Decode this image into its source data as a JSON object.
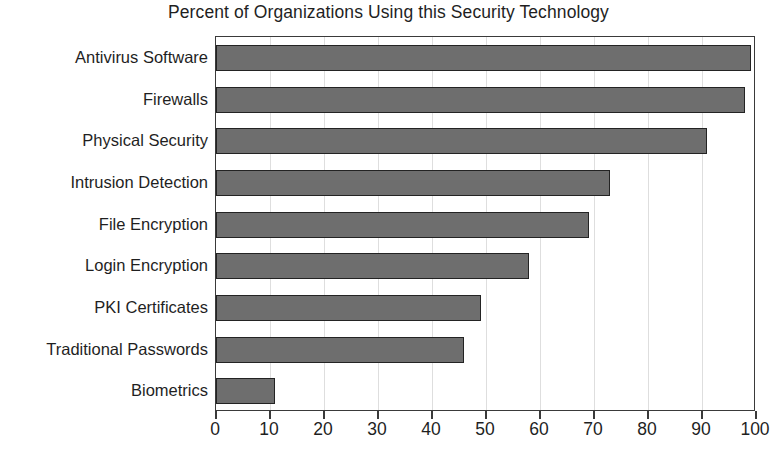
{
  "chart_data": {
    "type": "bar",
    "orientation": "horizontal",
    "title": "Percent of Organizations Using this Security Technology",
    "xlabel": "",
    "ylabel": "",
    "categories": [
      "Antivirus Software",
      "Firewalls",
      "Physical Security",
      "Intrusion Detection",
      "File Encryption",
      "Login Encryption",
      "PKI Certificates",
      "Traditional Passwords",
      "Biometrics"
    ],
    "values": [
      99,
      98,
      91,
      73,
      69,
      58,
      49,
      46,
      11
    ],
    "xlim": [
      0,
      100
    ],
    "xticks": [
      0,
      10,
      20,
      30,
      40,
      50,
      60,
      70,
      80,
      90,
      100
    ],
    "xticklabels": [
      "0",
      "10",
      "20",
      "30",
      "40",
      "50",
      "60",
      "70",
      "80",
      "90",
      "100"
    ],
    "grid": "vertical",
    "legend": null,
    "colors": {
      "bar_fill": "#6e6e6e",
      "bar_edge": "#232323",
      "gridline": "#dedede",
      "axis": "#3a3a3a",
      "text": "#1f1f1f",
      "background": "#ffffff"
    }
  }
}
